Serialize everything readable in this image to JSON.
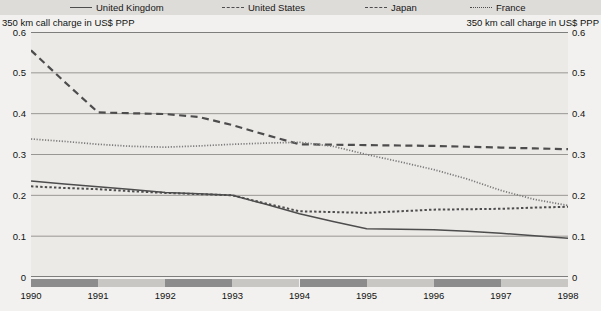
{
  "legend": {
    "items": [
      {
        "label": "United Kingdom",
        "style": "solid",
        "color": "#4d4d4d"
      },
      {
        "label": "United States",
        "style": "dashed-short",
        "color": "#4d4d4d"
      },
      {
        "label": "Japan",
        "style": "dashed-long",
        "color": "#4d4d4d"
      },
      {
        "label": "France",
        "style": "dotted",
        "color": "#4d4d4d"
      }
    ]
  },
  "axis_caption_left": "350 km call charge in US$ PPP",
  "axis_caption_right": "350 km call charge in US$ PPP",
  "chart_data": {
    "type": "line",
    "title": "",
    "subtitle": "",
    "xlabel": "",
    "ylabel": "350 km call charge in US$ PPP",
    "ylim": [
      0,
      0.6
    ],
    "xlim": [
      1990,
      1998
    ],
    "grid": true,
    "legend_position": "top",
    "ytick_labels": [
      "0.6",
      "0.5",
      "0.4",
      "0.3",
      "0.2",
      "0.1",
      "0"
    ],
    "ytick_values": [
      0.6,
      0.5,
      0.4,
      0.3,
      0.2,
      0.1,
      0
    ],
    "xtick_labels": [
      "1990",
      "1991",
      "1992",
      "1993",
      "1994",
      "1995",
      "1996",
      "1997",
      "1998"
    ],
    "xtick_values": [
      1990,
      1991,
      1992,
      1993,
      1994,
      1995,
      1996,
      1997,
      1998
    ],
    "x": [
      1990,
      1990.5,
      1991,
      1991.5,
      1992,
      1992.5,
      1993,
      1993.5,
      1994,
      1994.5,
      1995,
      1995.5,
      1996,
      1996.5,
      1997,
      1997.5,
      1998
    ],
    "series": [
      {
        "name": "United Kingdom",
        "style": "solid",
        "color": "#4d4d4d",
        "values": [
          0.235,
          0.228,
          0.221,
          0.214,
          0.207,
          0.204,
          0.2,
          0.178,
          0.155,
          0.136,
          0.118,
          0.117,
          0.116,
          0.112,
          0.107,
          0.101,
          0.095
        ]
      },
      {
        "name": "United States",
        "style": "dashed-short",
        "color": "#4d4d4d",
        "values": [
          0.222,
          0.218,
          0.215,
          0.21,
          0.206,
          0.203,
          0.2,
          0.18,
          0.161,
          0.159,
          0.157,
          0.161,
          0.165,
          0.166,
          0.167,
          0.17,
          0.172
        ]
      },
      {
        "name": "Japan",
        "style": "dashed-long",
        "color": "#4d4d4d",
        "values": [
          0.555,
          0.478,
          0.403,
          0.401,
          0.399,
          0.392,
          0.372,
          0.348,
          0.325,
          0.324,
          0.323,
          0.322,
          0.321,
          0.319,
          0.317,
          0.315,
          0.313
        ]
      },
      {
        "name": "France",
        "style": "dotted",
        "color": "#7a7a7a",
        "values": [
          0.338,
          0.332,
          0.325,
          0.32,
          0.318,
          0.321,
          0.325,
          0.328,
          0.33,
          0.32,
          0.3,
          0.282,
          0.263,
          0.24,
          0.212,
          0.19,
          0.175
        ]
      }
    ]
  },
  "xbands": [
    {
      "from": 1990,
      "to": 1991,
      "shade": "dark"
    },
    {
      "from": 1991,
      "to": 1992,
      "shade": "light"
    },
    {
      "from": 1992,
      "to": 1993,
      "shade": "dark"
    },
    {
      "from": 1993,
      "to": 1994,
      "shade": "light"
    },
    {
      "from": 1994,
      "to": 1995,
      "shade": "dark"
    },
    {
      "from": 1995,
      "to": 1996,
      "shade": "light"
    },
    {
      "from": 1996,
      "to": 1997,
      "shade": "dark"
    },
    {
      "from": 1997,
      "to": 1998,
      "shade": "light"
    }
  ]
}
